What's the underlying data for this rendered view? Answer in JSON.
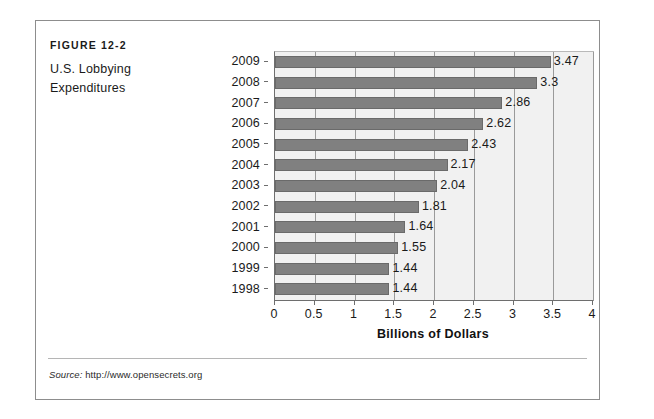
{
  "figure": {
    "label": "FIGURE 12-2",
    "caption_line1": "U.S. Lobbying",
    "caption_line2": "Expenditures"
  },
  "source": {
    "prefix": "Source:",
    "url": "http://www.opensecrets.org"
  },
  "colors": {
    "bar": "#808080",
    "plot_background": "#f1f1f1",
    "gridline": "#9a9a9a",
    "frame_border": "#8d8d8d"
  },
  "chart_data": {
    "type": "bar",
    "orientation": "horizontal",
    "title": "U.S. Lobbying Expenditures",
    "xlabel": "Billions of Dollars",
    "ylabel": "",
    "xlim": [
      0,
      4
    ],
    "xticks": [
      0,
      0.5,
      1,
      1.5,
      2,
      2.5,
      3,
      3.5,
      4
    ],
    "xtick_labels": [
      "0",
      "0.5",
      "1",
      "1.5",
      "2",
      "2.5",
      "3",
      "3.5",
      "4"
    ],
    "grid": true,
    "legend": false,
    "categories": [
      "2009",
      "2008",
      "2007",
      "2006",
      "2005",
      "2004",
      "2003",
      "2002",
      "2001",
      "2000",
      "1999",
      "1998"
    ],
    "values": [
      3.47,
      3.3,
      2.86,
      2.62,
      2.43,
      2.17,
      2.04,
      1.81,
      1.64,
      1.55,
      1.44,
      1.44
    ],
    "data_labels": [
      "3.47",
      "3.3",
      "2.86",
      "2.62",
      "2.43",
      "2.17",
      "2.04",
      "1.81",
      "1.64",
      "1.55",
      "1.44",
      "1.44"
    ]
  }
}
